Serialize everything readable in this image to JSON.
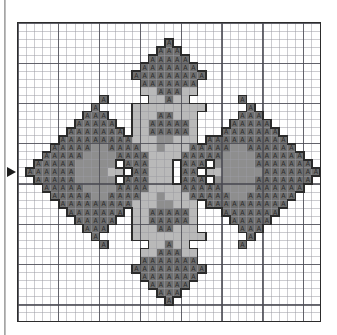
{
  "document": {
    "kind": "cross-stitch-chart",
    "title": "Cross Stitch Pattern Chart",
    "description": "Symmetric four-point star / floral medallion counted cross stitch chart"
  },
  "chart": {
    "grid_columns": 37,
    "grid_rows": 37,
    "cell_px": 8.2,
    "bold_every": 5,
    "grid_line_color": "#9c9ca2",
    "bold_line_color": "#4a4a52",
    "border_color": "#2c2c2c",
    "background_color": "#ffffff"
  },
  "markers": [
    {
      "name": "center-column-marker",
      "glyph": "triangle-down",
      "position": "top",
      "column": 18
    },
    {
      "name": "center-row-marker",
      "glyph": "triangle-right",
      "position": "left",
      "row": 18
    }
  ],
  "palette": {
    "white": "#ffffff",
    "light_gray": "#b9b9b9",
    "medium_gray": "#8e8e8e",
    "dark_gray": "#6f6f6f",
    "outline": "#2b2b2b",
    "symbol": "#2b2b2b"
  },
  "symbols": {
    "A": {
      "name": "triangle-symbol",
      "glyph": "A",
      "on_color": "dark_gray"
    }
  },
  "chart_data": {
    "type": "heatmap",
    "xlabel": "",
    "ylabel": "",
    "grid": true,
    "legend": "none",
    "cols": 37,
    "rows": 37,
    "codes": {
      "0": "white",
      "1": "light_gray",
      "2": "medium_gray",
      "3": "dark_gray_symbol"
    },
    "cells": [
      "0000000000000000000000000000000000000",
      "0000000000000000000000000000000000000",
      "0000000000000000003000000000000000000",
      "0000000000000000033300000000000000000",
      "0000000000000000333330000000000000000",
      "0000000000000003333333000000000000000",
      "0000000000000033333333300000000000000",
      "0000000000000003333333000000000000000",
      "0000000000000001133311000000000000000",
      "0000000000300000113110000003000000000",
      "0000000003000011111111100000300000000",
      "0000000033300011133111000003330000000",
      "0000000333330011333331000033333000000",
      "0000003333333011333331000333333300000",
      "0000033333333311122111033333333330000",
      "0000333332233331121113333322333333000",
      "0003333322223333111133333222233333300",
      "0033333222220333111033302222233333330",
      "0333333222211033111033011222223333333",
      "0033333222220333111033302222233333330",
      "0003333322223333111133333222233333300",
      "0000333332233331121113333322333333000",
      "0000033333333311122111033333333330000",
      "0000003333333011333331000333333300000",
      "0000000333330011333331000033333000000",
      "0000000033300011133111000003330000000",
      "0000000003000011111111100000300000000",
      "0000000000300000113110000003000000000",
      "0000000000000001133311000000000000000",
      "0000000000000003333333000000000000000",
      "0000000000000033333333300000000000000",
      "0000000000000003333333000000000000000",
      "0000000000000000333330000000000000000",
      "0000000000000000033300000000000000000",
      "0000000000000000003000000000000000000",
      "0000000000000000000000000000000000000",
      "0000000000000000000000000000000000000"
    ]
  }
}
